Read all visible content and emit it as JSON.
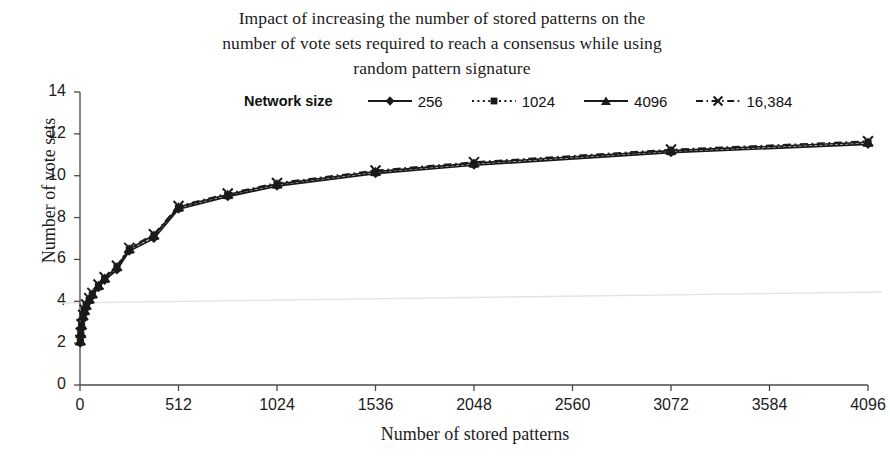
{
  "chart_data": {
    "type": "line",
    "title": "Impact of increasing the number of stored patterns on the number of vote sets required to reach a consensus while using random pattern signature",
    "title_lines": [
      "Impact of increasing the number of stored patterns on the",
      "number of vote sets required to reach a consensus while using",
      "random pattern signature"
    ],
    "xlabel": "Number of stored patterns",
    "ylabel": "Number of vote sets",
    "xlim": [
      0,
      4096
    ],
    "ylim": [
      0,
      14
    ],
    "xticks": [
      0,
      512,
      1024,
      1536,
      2048,
      2560,
      3072,
      3584,
      4096
    ],
    "xtick_labels": [
      "0",
      "512",
      "1024",
      "1536",
      "2048",
      "2560",
      "3072",
      "3584",
      "4096"
    ],
    "yticks": [
      0,
      2,
      4,
      6,
      8,
      10,
      12,
      14
    ],
    "ytick_labels": [
      "0",
      "2",
      "4",
      "6",
      "8",
      "10",
      "12",
      "14"
    ],
    "grid": false,
    "legend_title": "Network size",
    "legend_position": "top-center",
    "x": [
      2,
      4,
      8,
      16,
      24,
      32,
      48,
      64,
      96,
      128,
      192,
      256,
      384,
      512,
      768,
      1024,
      1536,
      2048,
      3072,
      4096
    ],
    "series": [
      {
        "name": "256",
        "label": "256",
        "marker": "diamond",
        "linestyle": "solid",
        "color": "#1a1a1a",
        "values": [
          2.0,
          2.35,
          2.75,
          3.2,
          3.45,
          3.7,
          4.0,
          4.25,
          4.65,
          5.0,
          5.5,
          6.4,
          7.0,
          8.4,
          9.0,
          9.5,
          10.1,
          10.5,
          11.1,
          11.5
        ]
      },
      {
        "name": "1024",
        "label": "1024",
        "marker": "square",
        "linestyle": "dotted",
        "color": "#1a1a1a",
        "values": [
          2.05,
          2.4,
          2.8,
          3.25,
          3.5,
          3.75,
          4.05,
          4.3,
          4.7,
          5.05,
          5.6,
          6.45,
          7.1,
          8.45,
          9.05,
          9.55,
          10.15,
          10.55,
          11.15,
          11.55
        ]
      },
      {
        "name": "4096",
        "label": "4096",
        "marker": "triangle",
        "linestyle": "solid",
        "color": "#1a1a1a",
        "values": [
          2.1,
          2.45,
          2.85,
          3.3,
          3.55,
          3.8,
          4.1,
          4.35,
          4.75,
          5.1,
          5.65,
          6.5,
          7.15,
          8.5,
          9.1,
          9.6,
          10.2,
          10.6,
          11.2,
          11.6
        ]
      },
      {
        "name": "16,384",
        "label": "16,384",
        "marker": "x",
        "linestyle": "dashdot",
        "color": "#1a1a1a",
        "values": [
          2.15,
          2.5,
          2.9,
          3.35,
          3.6,
          3.85,
          4.15,
          4.4,
          4.8,
          5.15,
          5.7,
          6.55,
          7.2,
          8.55,
          9.15,
          9.65,
          10.25,
          10.65,
          11.25,
          11.65
        ]
      }
    ]
  },
  "plot_geometry": {
    "left": 80,
    "right": 868,
    "top": 92,
    "bottom": 385
  }
}
